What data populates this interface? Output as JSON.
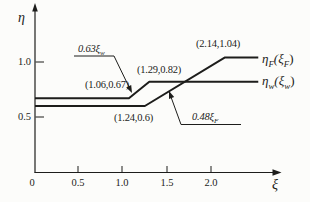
{
  "figure_bg": "#fcfcfa",
  "ink": "#1d1d1b",
  "axes": {
    "y_label": "η",
    "x_label": "ξ",
    "y_tick_labels": [
      "1.0",
      "0.5"
    ],
    "x_tick_labels": [
      "0",
      "0.5",
      "1.0",
      "1.5",
      "2.0"
    ]
  },
  "curve_labels": {
    "F": {
      "eta": "η",
      "eta_sub": "F",
      "arg_open": "(ξ",
      "arg_sub": "F",
      "arg_close": ")"
    },
    "w": {
      "eta": "η",
      "eta_sub": "w",
      "arg_open": "(ξ",
      "arg_sub": "w",
      "arg_close": ")"
    }
  },
  "annotations": {
    "slope_w": {
      "text": "0.63ξ",
      "sub": "w"
    },
    "slope_F": {
      "text": "0.48ξ",
      "sub": "F"
    },
    "point_w_knee": "(1.06,0.67)",
    "point_w_top": "(1.29,0.82)",
    "point_F_top": "(2.14,1.04)",
    "point_F_knee": "(1.24,0.6)"
  },
  "chart_data": {
    "type": "line",
    "title": "",
    "xlabel": "ξ",
    "ylabel": "η",
    "xlim": [
      0,
      2.78
    ],
    "ylim": [
      0,
      1.53
    ],
    "x_ticks": [
      0,
      0.5,
      1.0,
      1.5,
      2.0
    ],
    "y_ticks": [
      0.5,
      1.0
    ],
    "grid": false,
    "legend_position": "right-of-line-ends",
    "series": [
      {
        "name": "η_F(ξ_F)",
        "x": [
          0,
          1.24,
          2.14,
          2.52
        ],
        "y": [
          0.6,
          0.6,
          1.04,
          1.04
        ],
        "note": "rising segment follows η = 0.48ξ_F"
      },
      {
        "name": "η_w(ξ_w)",
        "x": [
          0,
          1.06,
          1.29,
          2.52
        ],
        "y": [
          0.67,
          0.67,
          0.82,
          0.82
        ],
        "note": "rising segment follows η = 0.63ξ_w"
      }
    ],
    "point_labels": [
      "(1.06,0.67)",
      "(1.29,0.82)",
      "(2.14,1.04)",
      "(1.24,0.6)"
    ]
  }
}
